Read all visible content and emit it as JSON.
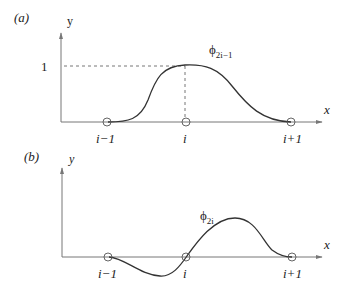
{
  "panels": [
    {
      "id": "a",
      "label": "(a)",
      "y_axis_label": "y",
      "x_axis_label": "x",
      "y_tick_label": "1",
      "node_labels": [
        "i−1",
        "i",
        "i+1"
      ],
      "function_symbol": "ϕ",
      "function_subscript": "2i−1",
      "description": "Hermite cubic shape function, value 1 at node i, 0 at nodes i-1 and i+1"
    },
    {
      "id": "b",
      "label": "(b)",
      "y_axis_label": "y",
      "x_axis_label": "x",
      "node_labels": [
        "i−1",
        "i",
        "i+1"
      ],
      "function_symbol": "ϕ",
      "function_subscript": "2i",
      "description": "Hermite cubic slope shape function, 0 at all nodes, unit slope at node i"
    }
  ],
  "colors": {
    "axis": "#777777",
    "curve": "#333333",
    "text": "#222222"
  }
}
